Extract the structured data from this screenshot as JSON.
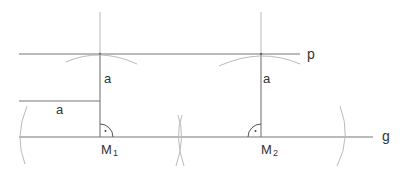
{
  "diagram": {
    "type": "geometric-construction",
    "colors": {
      "line": "#777777",
      "construction": "#bbbbbb",
      "text": "#333333"
    },
    "labels": {
      "line_g": "g",
      "line_p": "p",
      "point_m1_main": "M",
      "point_m1_sub": "1",
      "point_m2_main": "M",
      "point_m2_sub": "2",
      "distance_vertical_1": "a",
      "distance_vertical_2": "a",
      "distance_reference": "a"
    }
  }
}
